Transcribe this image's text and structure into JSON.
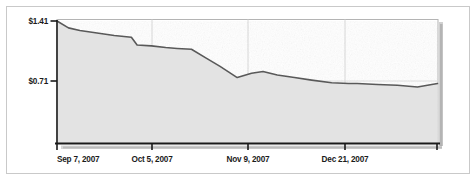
{
  "chart_data": {
    "type": "area",
    "title": "",
    "subtitle": "",
    "xlabel": "",
    "ylabel": "",
    "grid": "vertical-only",
    "legend": "none",
    "currency_prefix": "$",
    "ylim": [
      0.0,
      1.41
    ],
    "yticks": [
      0.71,
      1.41
    ],
    "ytick_labels": [
      "$0.71",
      "$1.41"
    ],
    "xtick_labels": [
      "Sep 7, 2007",
      "Oct 5, 2007",
      "Nov 9, 2007",
      "Dec 21, 2007"
    ],
    "xtick_positions": [
      0,
      28,
      63,
      105
    ],
    "xlim": [
      0,
      133
    ],
    "x": [
      0,
      4,
      8,
      14,
      20,
      26,
      28,
      33,
      38,
      42,
      47,
      52,
      57,
      63,
      68,
      72,
      77,
      83,
      89,
      96,
      102,
      105,
      112,
      119,
      126,
      133
    ],
    "series": [
      {
        "name": "Price",
        "values": [
          1.41,
          1.33,
          1.3,
          1.27,
          1.24,
          1.22,
          1.13,
          1.12,
          1.1,
          1.09,
          1.08,
          0.98,
          0.88,
          0.75,
          0.8,
          0.82,
          0.78,
          0.75,
          0.72,
          0.69,
          0.68,
          0.68,
          0.67,
          0.66,
          0.64,
          0.68
        ]
      }
    ],
    "colors": {
      "line": "#595959",
      "area_fill": "#e3e3e3",
      "axis": "#1b1b1b",
      "gridline": "#d8d8d8",
      "frame": "#c9c9c9",
      "shadow": "#8a8a8a",
      "background": "#ffffff"
    },
    "annotations": []
  }
}
